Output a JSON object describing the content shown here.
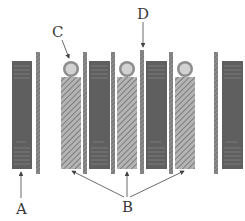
{
  "diagram": {
    "labels": {
      "A": "A",
      "B": "B",
      "C": "C",
      "D": "D"
    },
    "components": {
      "dark_blocks": 4,
      "hatched_blocks": 3,
      "thin_strips": 6,
      "circles": 3
    },
    "colors": {
      "dark_block": "#5f5f5f",
      "dark_block_lines": "#8a8a8a",
      "hatched_fill": "#a8a8a8",
      "hatch_line": "#6a6a6a",
      "thin_strip": "#7a7a7a",
      "circle_outer": "#9a9a9a",
      "circle_inner": "#cfcfcf",
      "arrow": "#444444"
    }
  }
}
